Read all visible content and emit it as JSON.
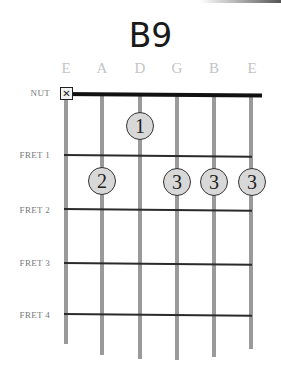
{
  "chord": {
    "name": "B9"
  },
  "strings": [
    {
      "label": "E",
      "x": 66
    },
    {
      "label": "A",
      "x": 102
    },
    {
      "label": "D",
      "x": 140
    },
    {
      "label": "G",
      "x": 177
    },
    {
      "label": "B",
      "x": 214
    },
    {
      "label": "E",
      "x": 252
    }
  ],
  "rows": {
    "nut": "NUT",
    "fret1": "FRET 1",
    "fret2": "FRET 2",
    "fret3": "FRET 3",
    "fret4": "FRET 4"
  },
  "muted": {
    "string": "E (low)",
    "symbol": "✕"
  },
  "fingers": [
    {
      "string": "D",
      "fret": 1,
      "finger": "1"
    },
    {
      "string": "A",
      "fret": 2,
      "finger": "2"
    },
    {
      "string": "G",
      "fret": 2,
      "finger": "3"
    },
    {
      "string": "B",
      "fret": 2,
      "finger": "3"
    },
    {
      "string": "E (high)",
      "fret": 2,
      "finger": "3"
    }
  ],
  "colors": {
    "finger_fill": "#d8d8d8",
    "string": "#9a9a9a",
    "nut": "#111111",
    "label": "#c4c4c4"
  }
}
